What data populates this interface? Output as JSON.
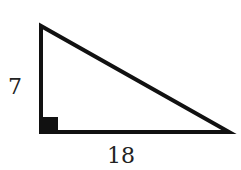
{
  "diagram": {
    "type": "right-triangle",
    "labels": {
      "vertical_leg": "7",
      "horizontal_leg": "18"
    },
    "right_angle_marker": "bottom-left",
    "stroke_color": "#111111"
  }
}
